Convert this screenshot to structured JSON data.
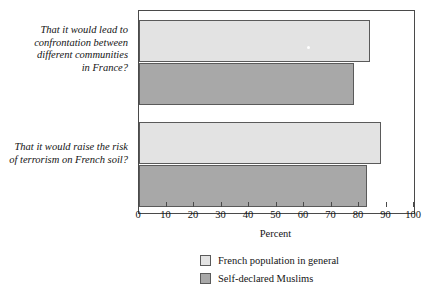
{
  "chart_data": {
    "type": "bar",
    "orientation": "horizontal",
    "title": "",
    "xlabel": "Percent",
    "ylabel": "",
    "xlim": [
      0,
      100
    ],
    "xticks": [
      0,
      10,
      20,
      30,
      40,
      50,
      60,
      70,
      80,
      90,
      100
    ],
    "grid": false,
    "legend_position": "bottom-center",
    "categories": [
      "That it would lead to confrontation between different communities in France?",
      "That it would raise the risk of terrorism on French soil?"
    ],
    "category_lines": [
      [
        "That it would lead to",
        "confrontation between",
        "different communities",
        "in France?"
      ],
      [
        "That it would raise the risk",
        "of terrorism on French soil?"
      ]
    ],
    "series": [
      {
        "name": "French population in general",
        "color": "#e3e3e3",
        "values": [
          84,
          88
        ]
      },
      {
        "name": "Self-declared Muslims",
        "color": "#a8a8a8",
        "values": [
          78,
          83
        ]
      }
    ]
  },
  "axis": {
    "title": "Percent",
    "tick_labels": [
      "0",
      "10",
      "20",
      "30",
      "40",
      "50",
      "60",
      "70",
      "80",
      "90",
      "100"
    ]
  },
  "legend": {
    "entries": [
      {
        "label": "French population in general",
        "swatch": "light-gray-swatch"
      },
      {
        "label": "Self-declared Muslims",
        "swatch": "dark-gray-swatch"
      }
    ]
  },
  "colors": {
    "series_light": "#e3e3e3",
    "series_dark": "#a8a8a8",
    "bar_border": "#5a5a5a",
    "frame": "#4a4a4a",
    "text": "#141414",
    "background": "#ffffff"
  }
}
